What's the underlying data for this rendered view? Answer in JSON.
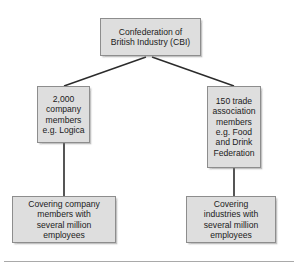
{
  "diagram": {
    "type": "organisational-hierarchy",
    "title_node": "root",
    "nodes": [
      {
        "id": "root",
        "name": "confederation-of-british-industry",
        "text": "Confederation of\nBritish Industry (CBI)"
      },
      {
        "id": "company-members",
        "name": "company-members",
        "text": "2,000\ncompany\nmembers\ne.g. Logica"
      },
      {
        "id": "trade-associations",
        "name": "trade-association-members",
        "text": "150 trade\nassociation\nmembers\ne.g. Food\nand Drink\nFederation"
      },
      {
        "id": "covering-company",
        "name": "covering-company-members",
        "text": "Covering company\nmembers with\nseveral million\nemployees"
      },
      {
        "id": "covering-industries",
        "name": "covering-industries",
        "text": "Covering\nindustries with\nseveral million\nemployees"
      }
    ],
    "edges": [
      {
        "from": "root",
        "to": "company-members",
        "style": "diagonal"
      },
      {
        "from": "root",
        "to": "trade-associations",
        "style": "diagonal"
      },
      {
        "from": "company-members",
        "to": "covering-company",
        "style": "vertical"
      },
      {
        "from": "trade-associations",
        "to": "covering-industries",
        "style": "vertical"
      }
    ],
    "colors": {
      "box_fill": "#dedede",
      "box_border": "#8d8d8d",
      "connector": "#2b2b2b",
      "text": "#1b1b1b",
      "rule": "#a9a9a9",
      "background": "#ffffff"
    }
  }
}
